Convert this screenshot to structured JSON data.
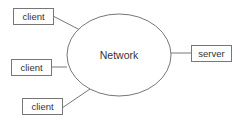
{
  "diagram": {
    "center": {
      "label": "Network",
      "shape": "ellipse"
    },
    "nodes": [
      {
        "id": "client-1",
        "label": "client",
        "shape": "rectangle"
      },
      {
        "id": "client-2",
        "label": "client",
        "shape": "rectangle"
      },
      {
        "id": "client-3",
        "label": "client",
        "shape": "rectangle"
      },
      {
        "id": "server",
        "label": "server",
        "shape": "rectangle"
      }
    ],
    "edges": [
      {
        "from": "client-1",
        "to": "Network"
      },
      {
        "from": "client-2",
        "to": "Network"
      },
      {
        "from": "client-3",
        "to": "Network"
      },
      {
        "from": "Network",
        "to": "server"
      }
    ],
    "colors": {
      "stroke": "#777777",
      "text": "#333333",
      "background": "#ffffff"
    }
  }
}
